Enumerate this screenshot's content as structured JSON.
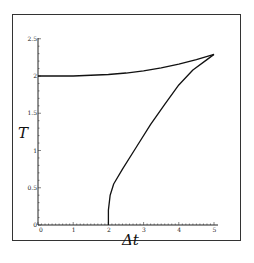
{
  "chart_data": {
    "type": "line",
    "title": "",
    "xlabel": "Δt",
    "ylabel": "T",
    "xlim": [
      0,
      5
    ],
    "ylim": [
      0,
      2.5
    ],
    "x_ticks": [
      "0",
      "1",
      "2",
      "3",
      "4",
      "5"
    ],
    "y_ticks": [
      "0",
      "0.5",
      "1",
      "1.5",
      "2",
      "2.5"
    ],
    "grid": false,
    "legend": null,
    "series": [
      {
        "name": "upper-branch",
        "x": [
          0,
          0.5,
          1,
          1.5,
          2,
          2.5,
          3,
          3.5,
          4,
          4.5,
          5
        ],
        "y": [
          2.0,
          2.0,
          2.0,
          2.01,
          2.02,
          2.04,
          2.07,
          2.11,
          2.16,
          2.22,
          2.29
        ]
      },
      {
        "name": "lower-branch",
        "x": [
          2.0,
          2.0,
          2.05,
          2.15,
          2.4,
          2.8,
          3.2,
          3.6,
          4.0,
          4.4,
          4.8,
          5.0
        ],
        "y": [
          0.0,
          0.2,
          0.4,
          0.55,
          0.75,
          1.05,
          1.35,
          1.62,
          1.88,
          2.08,
          2.22,
          2.29
        ]
      }
    ]
  }
}
